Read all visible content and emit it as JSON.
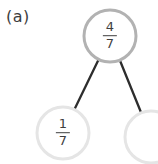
{
  "label": "(a)",
  "colors": {
    "background": "#ffffff",
    "root_circle_border": "#b2b2b2",
    "child_circle_border": "#e5e5e5",
    "connector_line": "#2d2d2d",
    "fraction_text": "#3f3f3f"
  },
  "tree": {
    "parent": {
      "numerator": "4",
      "denominator": "7"
    },
    "children": [
      {
        "numerator": "1",
        "denominator": "7"
      },
      {
        "numerator": "",
        "denominator": ""
      }
    ]
  }
}
